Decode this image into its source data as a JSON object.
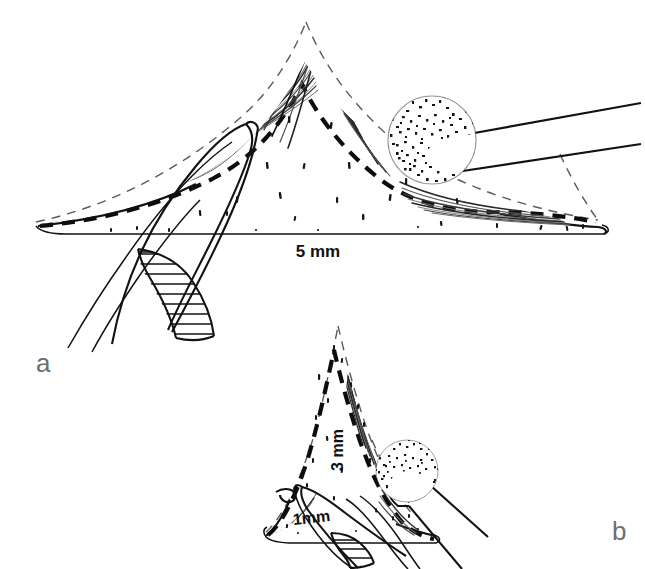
{
  "figure": {
    "background_color": "#ffffff",
    "ink_color": "#111111",
    "panel_letter_color": "#6e6e6e",
    "width": 645,
    "height": 569
  },
  "panels": [
    {
      "id": "panel-a",
      "letter": "a",
      "letter_x": 36,
      "letter_y": 372,
      "letter_size": 26,
      "view": "broad dorsal hump profile, lateral view",
      "scale_label": {
        "text": "5 mm",
        "x": 318,
        "y": 257,
        "size": 17,
        "rotation": 0
      },
      "structures": [
        "original-contour-dashed-triangle",
        "reduced-contour-bold-dashed-arc",
        "cartilage-body-outline",
        "shaving-hatch-strokes",
        "cartilage-stipple-marks",
        "retractor-instrument-hatched",
        "burr-sphere-stippled",
        "burr-shaft"
      ]
    },
    {
      "id": "panel-b",
      "letter": "b",
      "letter_x": 612,
      "letter_y": 540,
      "letter_size": 26,
      "view": "narrow dorsal hump profile, lateral view",
      "scale_labels": [
        {
          "text": "3 mm",
          "x": 343,
          "y": 450,
          "size": 16,
          "rotation": -90
        },
        {
          "text": "1mm",
          "x": 312,
          "y": 523,
          "size": 16,
          "rotation": -6
        }
      ],
      "structures": [
        "original-contour-dashed-triangle",
        "reduced-contour-bold-dashed-arc",
        "cartilage-body-outline",
        "shaving-hatch-strokes",
        "cartilage-stipple-marks",
        "retractor-instrument-hatched",
        "burr-sphere-stippled",
        "burr-shaft"
      ]
    }
  ],
  "legend_notes": {
    "dashed_thin": "original uncorrected contour",
    "dashed_bold": "post-reduction contour",
    "stippled_sphere": "spherical diamond burr head",
    "hatched_band": "retractor / soft-tissue elevator"
  }
}
